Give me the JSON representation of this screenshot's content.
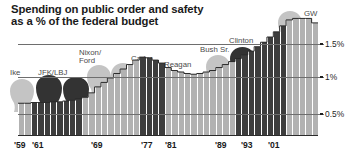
{
  "title": "Spending on public order and safety\nas a % of the federal budget",
  "colors": {
    "bar_light": "#b2b2b2",
    "bar_dark": "#3d3d3d",
    "head_light": "#c4c4c4",
    "head_dark": "#333333",
    "text": "#1a1a1a",
    "gridline": "#6e6e6e"
  },
  "axis": {
    "y_labels": [
      "1.5%",
      "1%",
      "0.5%"
    ],
    "y_values": [
      1.5,
      1.0,
      0.5
    ],
    "x_labels": [
      "'59",
      "'61",
      "'69",
      "'77",
      "'81",
      "'89",
      "'93",
      "'01"
    ]
  },
  "presidents": [
    {
      "name": "Ike",
      "shade": "light"
    },
    {
      "name": "JFK/LBJ",
      "shade": "dark"
    },
    {
      "name": "Nixon/\nFord",
      "shade": "light"
    },
    {
      "name": "Carter",
      "shade": "dark"
    },
    {
      "name": "Reagan",
      "shade": "light"
    },
    {
      "name": "Bush Sr.",
      "shade": "light"
    },
    {
      "name": "Clinton",
      "shade": "dark"
    },
    {
      "name": "GW",
      "shade": "light"
    }
  ],
  "chart_data": {
    "type": "bar",
    "title": "Spending on public order and safety as a % of the federal budget",
    "xlabel": "",
    "ylabel": "% of the federal budget",
    "ylim": [
      0,
      1.72
    ],
    "grid": true,
    "legend": "none",
    "yticks": [
      0.5,
      1.0,
      1.5
    ],
    "ytick_labels": [
      "0.5%",
      "1%",
      "1.5%"
    ],
    "annotations": [
      "Ike",
      "JFK/LBJ",
      "Nixon/Ford",
      "Carter",
      "Reagan",
      "Bush Sr.",
      "Clinton",
      "GW"
    ],
    "categories": [
      "'59",
      "'60",
      "'61",
      "'62",
      "'63",
      "'64",
      "'65",
      "'66",
      "'67",
      "'68",
      "'69",
      "'70",
      "'71",
      "'72",
      "'73",
      "'74",
      "'75",
      "'76",
      "'77",
      "'78",
      "'79",
      "'80",
      "'81",
      "'82",
      "'83",
      "'84",
      "'85",
      "'86",
      "'87",
      "'88",
      "'89",
      "'90",
      "'91",
      "'92",
      "'93",
      "'94",
      "'95",
      "'96",
      "'97",
      "'98",
      "'99",
      "'00",
      "'01",
      "'02",
      "'03",
      "'04",
      "'05"
    ],
    "values": [
      0.44,
      0.44,
      0.45,
      0.45,
      0.45,
      0.46,
      0.46,
      0.47,
      0.48,
      0.5,
      0.52,
      0.58,
      0.66,
      0.72,
      0.78,
      0.84,
      0.9,
      0.96,
      1.02,
      1.06,
      1.05,
      1.02,
      0.98,
      0.92,
      0.88,
      0.86,
      0.84,
      0.83,
      0.84,
      0.86,
      0.88,
      0.92,
      0.96,
      1.0,
      1.04,
      1.09,
      1.14,
      1.2,
      1.26,
      1.33,
      1.4,
      1.48,
      1.56,
      1.58,
      1.58,
      1.58,
      1.52
    ],
    "series": [
      {
        "name": "Public order and safety spending",
        "values": [
          0.44,
          0.44,
          0.45,
          0.45,
          0.45,
          0.46,
          0.46,
          0.47,
          0.48,
          0.5,
          0.52,
          0.58,
          0.66,
          0.72,
          0.78,
          0.84,
          0.9,
          0.96,
          1.02,
          1.06,
          1.05,
          1.02,
          0.98,
          0.92,
          0.88,
          0.86,
          0.84,
          0.83,
          0.84,
          0.86,
          0.88,
          0.92,
          0.96,
          1.0,
          1.04,
          1.09,
          1.14,
          1.2,
          1.26,
          1.33,
          1.4,
          1.48,
          1.56,
          1.58,
          1.58,
          1.58,
          1.52
        ]
      }
    ],
    "bar_shades": [
      "light",
      "light",
      "dark",
      "dark",
      "dark",
      "dark",
      "dark",
      "dark",
      "dark",
      "dark",
      "light",
      "light",
      "light",
      "light",
      "light",
      "light",
      "light",
      "light",
      "light",
      "dark",
      "dark",
      "dark",
      "dark",
      "light",
      "light",
      "light",
      "light",
      "light",
      "light",
      "light",
      "light",
      "light",
      "light",
      "light",
      "dark",
      "dark",
      "dark",
      "dark",
      "dark",
      "dark",
      "dark",
      "dark",
      "light",
      "light",
      "light",
      "light",
      "light"
    ]
  }
}
